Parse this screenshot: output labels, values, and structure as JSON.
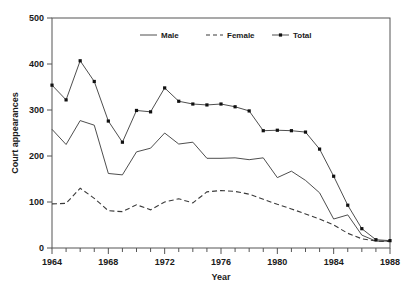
{
  "top_caption": "",
  "chart_data": {
    "type": "line",
    "title": "",
    "xlabel": "Year",
    "ylabel": "Court appearances",
    "xlim": [
      1964,
      1988
    ],
    "ylim": [
      0,
      500
    ],
    "y_ticks": [
      0,
      100,
      200,
      300,
      400,
      500
    ],
    "x_ticks": [
      1964,
      1968,
      1972,
      1976,
      1980,
      1984,
      1988
    ],
    "x_minor_step": 1,
    "grid": false,
    "legend_position": "top-center",
    "x": [
      1964,
      1965,
      1966,
      1967,
      1968,
      1969,
      1970,
      1971,
      1972,
      1973,
      1974,
      1975,
      1976,
      1977,
      1978,
      1979,
      1980,
      1981,
      1982,
      1983,
      1984,
      1985,
      1986,
      1987,
      1988
    ],
    "series": [
      {
        "name": "Male",
        "style": "solid",
        "markers": false,
        "values": [
          258,
          225,
          277,
          267,
          162,
          159,
          209,
          217,
          250,
          226,
          230,
          195,
          195,
          196,
          192,
          196,
          153,
          167,
          147,
          120,
          63,
          72,
          28,
          15,
          15
        ]
      },
      {
        "name": "Female",
        "style": "dashed",
        "markers": false,
        "values": [
          96,
          97,
          130,
          108,
          81,
          79,
          94,
          83,
          100,
          107,
          98,
          122,
          125,
          123,
          117,
          106,
          95,
          85,
          74,
          63,
          50,
          32,
          20,
          15,
          14
        ]
      },
      {
        "name": "Total",
        "style": "solid",
        "markers": true,
        "values": [
          354,
          322,
          407,
          362,
          276,
          230,
          299,
          296,
          348,
          319,
          313,
          311,
          313,
          307,
          298,
          255,
          256,
          255,
          252,
          215,
          156,
          93,
          42,
          18,
          16
        ]
      }
    ]
  },
  "legend": [
    {
      "label": "Male",
      "swatch": "line-solid"
    },
    {
      "label": "Female",
      "swatch": "line-dashed"
    },
    {
      "label": "Total",
      "swatch": "line-marker"
    }
  ],
  "colors": {
    "line": "#3a3a3a",
    "marker": "#111111",
    "axis": "#555555",
    "text": "#1a1a1a",
    "background": "#ffffff"
  }
}
